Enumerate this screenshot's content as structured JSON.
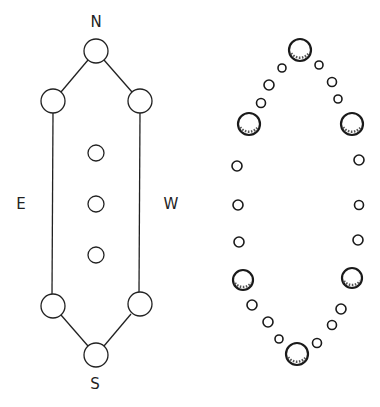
{
  "diagram": {
    "left_plan": {
      "labels": {
        "north": "N",
        "east": "E",
        "west": "W",
        "south": "S"
      },
      "outer_nodes": [
        {
          "id": "n",
          "x": 96,
          "y": 51,
          "r": 12
        },
        {
          "id": "ne",
          "x": 53,
          "y": 101,
          "r": 12
        },
        {
          "id": "nw",
          "x": 140,
          "y": 101,
          "r": 12
        },
        {
          "id": "se",
          "x": 53,
          "y": 306,
          "r": 12
        },
        {
          "id": "sw",
          "x": 140,
          "y": 304,
          "r": 12
        },
        {
          "id": "s",
          "x": 96,
          "y": 355,
          "r": 12
        }
      ],
      "inner_nodes": [
        {
          "x": 96,
          "y": 153,
          "r": 8
        },
        {
          "x": 96,
          "y": 204,
          "r": 8
        },
        {
          "x": 96,
          "y": 255,
          "r": 8
        }
      ]
    },
    "right_plan": {
      "large_stones": [
        {
          "x": 300,
          "y": 50,
          "r": 11
        },
        {
          "x": 249,
          "y": 124,
          "r": 11
        },
        {
          "x": 352,
          "y": 124,
          "r": 11
        },
        {
          "x": 243,
          "y": 280,
          "r": 10
        },
        {
          "x": 352,
          "y": 278,
          "r": 10
        },
        {
          "x": 297,
          "y": 354,
          "r": 11
        }
      ],
      "small_stones": [
        {
          "x": 282,
          "y": 68,
          "r": 4
        },
        {
          "x": 269,
          "y": 85,
          "r": 5
        },
        {
          "x": 261,
          "y": 103,
          "r": 4.5
        },
        {
          "x": 319,
          "y": 65,
          "r": 4
        },
        {
          "x": 332,
          "y": 82,
          "r": 4.5
        },
        {
          "x": 338,
          "y": 99,
          "r": 4
        },
        {
          "x": 237,
          "y": 166,
          "r": 5
        },
        {
          "x": 359,
          "y": 160,
          "r": 5
        },
        {
          "x": 238,
          "y": 205,
          "r": 5
        },
        {
          "x": 359,
          "y": 205,
          "r": 4.5
        },
        {
          "x": 239,
          "y": 242,
          "r": 5
        },
        {
          "x": 358,
          "y": 240,
          "r": 5
        },
        {
          "x": 252,
          "y": 305,
          "r": 5
        },
        {
          "x": 341,
          "y": 309,
          "r": 5
        },
        {
          "x": 268,
          "y": 322,
          "r": 5
        },
        {
          "x": 332,
          "y": 325,
          "r": 4.5
        },
        {
          "x": 279,
          "y": 339,
          "r": 4
        },
        {
          "x": 317,
          "y": 343,
          "r": 4.5
        }
      ]
    }
  }
}
